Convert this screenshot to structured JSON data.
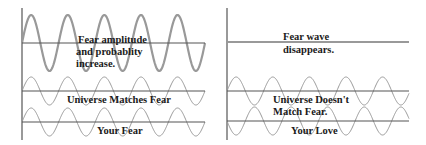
{
  "left_panel": {
    "top_label": [
      "Fear amplitude",
      "and probablity",
      "increase."
    ],
    "middle_label": "Universe Matches Fear",
    "bottom_label": "Your Fear"
  },
  "right_panel": {
    "top_label": [
      "Fear wave",
      "disappears."
    ],
    "middle_label": [
      "Universe Doesn't",
      "Match Fear."
    ],
    "bottom_label": "Your Love"
  },
  "colors": {
    "axis": "#555555",
    "wave": "#999999",
    "text": "#1a1a1a"
  }
}
